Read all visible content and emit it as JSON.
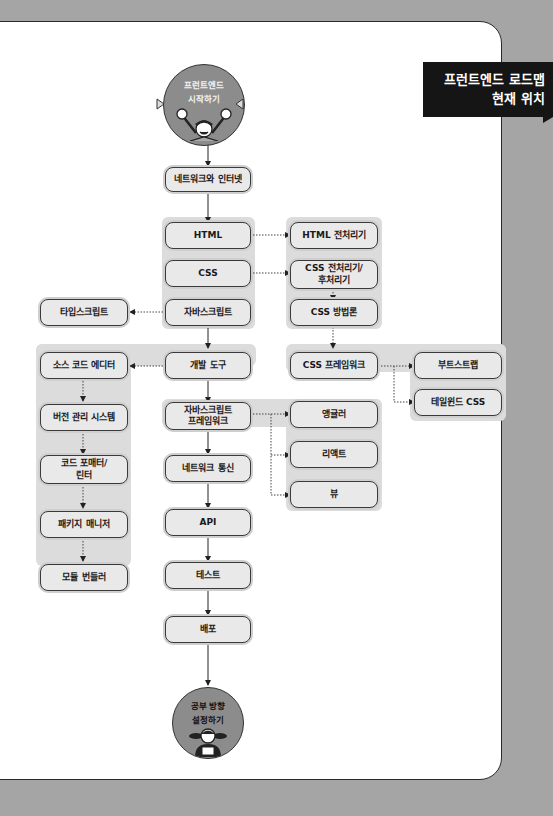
{
  "badge": {
    "title": "프런트엔드 로드맵\n현재 위치"
  },
  "start": {
    "label": "프런트엔드\n시작하기",
    "icon": "cheering-person-icon"
  },
  "end": {
    "label": "공부 방향\n설정하기",
    "icon": "studying-person-icon"
  },
  "main_path": [
    {
      "id": "network",
      "label": "네트워크와 인터넷"
    },
    {
      "id": "html",
      "label": "HTML"
    },
    {
      "id": "css",
      "label": "CSS"
    },
    {
      "id": "javascript",
      "label": "자바스크립트"
    },
    {
      "id": "devtools",
      "label": "개발 도구"
    },
    {
      "id": "js-framework",
      "label": "자바스크립트\n프레임워크"
    },
    {
      "id": "network-comm",
      "label": "네트워크 통신"
    },
    {
      "id": "api",
      "label": "API"
    },
    {
      "id": "test",
      "label": "테스트"
    },
    {
      "id": "deploy",
      "label": "배포"
    }
  ],
  "css_branch": [
    {
      "id": "html-preprocessor",
      "label": "HTML 전처리기"
    },
    {
      "id": "css-preprocessor",
      "label": "CSS 전처리기/\n후처리기"
    },
    {
      "id": "css-methodology",
      "label": "CSS 방법론"
    },
    {
      "id": "css-framework",
      "label": "CSS 프레임워크"
    }
  ],
  "css_framework_branch": [
    {
      "id": "bootstrap",
      "label": "부트스트랩"
    },
    {
      "id": "tailwind",
      "label": "테일윈드 CSS"
    }
  ],
  "typescript": {
    "label": "타입스크립트"
  },
  "tools_branch": [
    {
      "id": "source-editor",
      "label": "소스 코드 에디터"
    },
    {
      "id": "vcs",
      "label": "버전 관리 시스템"
    },
    {
      "id": "formatter",
      "label": "코드 포매터/\n린터"
    },
    {
      "id": "package-manager",
      "label": "패키지 매니저"
    },
    {
      "id": "bundler",
      "label": "모듈 번들러"
    }
  ],
  "js_framework_branch": [
    {
      "id": "angular",
      "label": "앵귤러"
    },
    {
      "id": "react",
      "label": "리액트"
    },
    {
      "id": "vue",
      "label": "뷰"
    }
  ]
}
